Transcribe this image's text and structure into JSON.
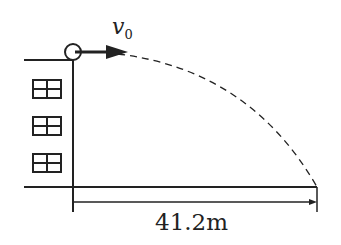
{
  "diagram": {
    "velocity_label": {
      "symbol": "v",
      "subscript": "0"
    },
    "distance_label": "41.2m",
    "building": {
      "windows": 3
    },
    "colors": {
      "line": "#222222",
      "background": "#ffffff"
    }
  }
}
